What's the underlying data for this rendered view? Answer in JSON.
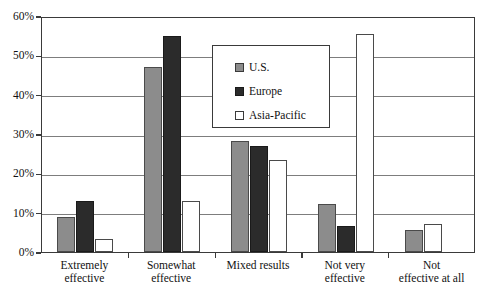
{
  "chart_data": {
    "type": "bar",
    "title": "",
    "subtitle": "",
    "xlabel": "",
    "ylabel": "",
    "ylim": [
      0,
      60
    ],
    "ytick_labels": [
      "0%",
      "10%",
      "20%",
      "30%",
      "40%",
      "50%",
      "60%"
    ],
    "ytick_values": [
      0,
      10,
      20,
      30,
      40,
      50,
      60
    ],
    "grid": true,
    "legend_position": "upper-center",
    "categories": [
      "Extremely effective",
      "Somewhat effective",
      "Mixed results",
      "Not very effective",
      "Not effective at all"
    ],
    "category_lines": [
      [
        "Extremely",
        "effective"
      ],
      [
        "Somewhat",
        "effective"
      ],
      [
        "Mixed results",
        ""
      ],
      [
        "Not very",
        "effective"
      ],
      [
        "Not",
        "effective at all"
      ]
    ],
    "series": [
      {
        "name": "U.S.",
        "color": "#8c8c8c",
        "values": [
          9.0,
          47.0,
          28.2,
          12.3,
          5.5
        ]
      },
      {
        "name": "Europe",
        "color": "#2b2b2b",
        "values": [
          13.0,
          55.0,
          27.0,
          6.5,
          0
        ]
      },
      {
        "name": "Asia-Pacific",
        "color": "#ffffff",
        "values": [
          3.2,
          13.0,
          23.5,
          55.5,
          7.0
        ]
      }
    ]
  },
  "legend": {
    "items": [
      {
        "label": "U.S.",
        "swatch": "legend-swatch-us"
      },
      {
        "label": "Europe",
        "swatch": "legend-swatch-europe"
      },
      {
        "label": "Asia-Pacific",
        "swatch": "legend-swatch-asia-pacific"
      }
    ]
  }
}
